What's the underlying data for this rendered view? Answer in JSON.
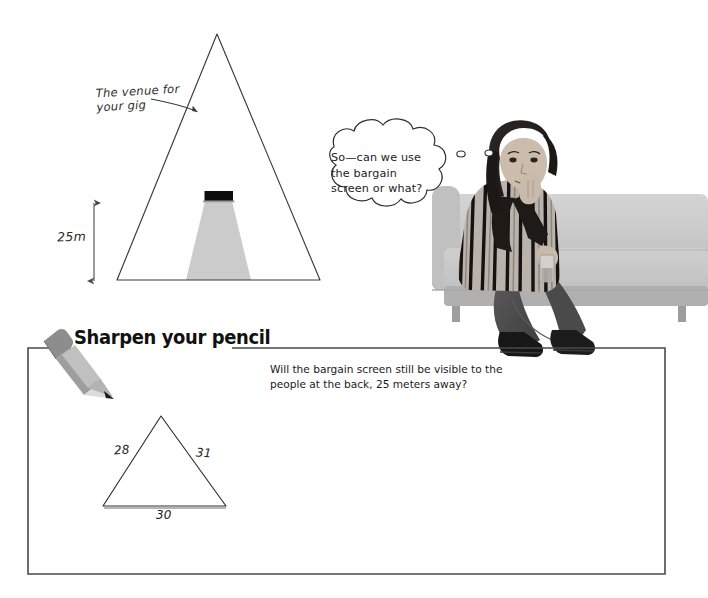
{
  "page": {
    "background_color": "#ffffff",
    "width": 708,
    "height": 598
  },
  "venue_diagram": {
    "annotation": "The venue for\nyour gig",
    "height_label": "25m",
    "screen_name": "bargain-screen",
    "screen_color": "#111111",
    "beam_color": "#cccccc",
    "outline_color": "#3a3a3a"
  },
  "thought_bubble": {
    "text": "So—can we use\nthe bargain\nscreen or what?",
    "outline_color": "#2e2e2e"
  },
  "photo": {
    "subject": "person-sitting-on-couch",
    "couch_color": "#c9c9c9",
    "alt": "Grayscale photo of a person sitting on a couch resting chin on hand"
  },
  "exercise": {
    "title": "Sharpen your pencil",
    "icon": "pencil-icon",
    "question": "Will the bargain screen still be visible to the\npeople at the back, 25 meters away?",
    "box_border_color": "#4a4a4a"
  },
  "exercise_triangle": {
    "side_left": "28",
    "side_right": "31",
    "base": "30",
    "stroke_color": "#2e2e2e"
  }
}
